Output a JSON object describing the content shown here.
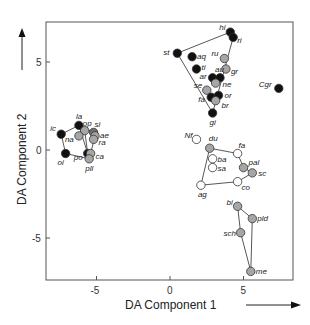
{
  "chart_data": {
    "type": "scatter",
    "title": "",
    "xlabel": "DA Component 1",
    "ylabel": "DA Component 2",
    "xlim": [
      -8.5,
      8.3
    ],
    "ylim": [
      -7.4,
      7.2
    ],
    "xticks": [
      -5,
      0,
      5
    ],
    "yticks": [
      -5,
      0,
      5
    ],
    "grid": false,
    "legend": null,
    "colors": {
      "black": "#111111",
      "gray": "#a6a6a6",
      "darkgray": "#6e6e6e",
      "white": "#ffffff"
    },
    "points": [
      {
        "label": "hi",
        "x": 4.1,
        "y": 6.7,
        "fill": "black",
        "lx": -11,
        "ly": -2
      },
      {
        "label": "ri",
        "x": 4.3,
        "y": 6.4,
        "fill": "black",
        "lx": 4,
        "ly": 6
      },
      {
        "label": "st",
        "x": 0.5,
        "y": 5.5,
        "fill": "black",
        "lx": -14,
        "ly": 2
      },
      {
        "label": "aq",
        "x": 1.5,
        "y": 5.3,
        "fill": "black",
        "lx": 5,
        "ly": 2
      },
      {
        "label": "ti",
        "x": 1.8,
        "y": 4.6,
        "fill": "black",
        "lx": 5,
        "ly": 1
      },
      {
        "label": "ru",
        "x": 3.7,
        "y": 5.2,
        "fill": "gray",
        "lx": -13,
        "ly": -3
      },
      {
        "label": "gr",
        "x": 3.8,
        "y": 4.6,
        "fill": "gray",
        "lx": 5,
        "ly": 5
      },
      {
        "label": "ar",
        "x": 2.9,
        "y": 4.1,
        "fill": "black",
        "lx": -13,
        "ly": 1
      },
      {
        "label": "au",
        "x": 3.4,
        "y": 4.1,
        "fill": "black",
        "lx": -5,
        "ly": -6
      },
      {
        "label": "ne",
        "x": 3.1,
        "y": 3.8,
        "fill": "gray",
        "lx": 7,
        "ly": 4
      },
      {
        "label": "se",
        "x": 2.5,
        "y": 3.4,
        "fill": "gray",
        "lx": -13,
        "ly": -2
      },
      {
        "label": "or",
        "x": 3.3,
        "y": 3.1,
        "fill": "black",
        "lx": 6,
        "ly": 3
      },
      {
        "label": "fa",
        "x": 2.8,
        "y": 3.0,
        "fill": "black",
        "lx": -13,
        "ly": 5
      },
      {
        "label": "br",
        "x": 3.1,
        "y": 2.8,
        "fill": "gray",
        "lx": 6,
        "ly": 7
      },
      {
        "label": "gi",
        "x": 2.9,
        "y": 2.1,
        "fill": "black",
        "lx": -3,
        "ly": 12
      },
      {
        "label": "Cgr",
        "x": 7.4,
        "y": 3.5,
        "fill": "black",
        "lx": -20,
        "ly": -1
      },
      {
        "label": "la",
        "x": -6.2,
        "y": 1.4,
        "fill": "black",
        "lx": -3,
        "ly": -6
      },
      {
        "label": "ic",
        "x": -7.4,
        "y": 0.9,
        "fill": "black",
        "lx": -11,
        "ly": -3
      },
      {
        "label": "op",
        "x": -5.8,
        "y": 1.1,
        "fill": "gray",
        "lx": -2,
        "ly": -5
      },
      {
        "label": "si",
        "x": -5.2,
        "y": 1.0,
        "fill": "darkgray",
        "lx": 1,
        "ly": -5
      },
      {
        "label": "ae",
        "x": -5.1,
        "y": 0.8,
        "fill": "gray",
        "lx": 5,
        "ly": 2
      },
      {
        "label": "na",
        "x": -6.2,
        "y": 0.8,
        "fill": "gray",
        "lx": -14,
        "ly": 6
      },
      {
        "label": "ra",
        "x": -5.2,
        "y": 0.6,
        "fill": "gray",
        "lx": 5,
        "ly": 6
      },
      {
        "label": "oi",
        "x": -7.1,
        "y": -0.2,
        "fill": "black",
        "lx": -8,
        "ly": 11
      },
      {
        "label": "po",
        "x": -5.6,
        "y": -0.2,
        "fill": "black",
        "lx": -14,
        "ly": 6
      },
      {
        "label": "ca",
        "x": -5.4,
        "y": -0.2,
        "fill": "gray",
        "lx": 5,
        "ly": 5
      },
      {
        "label": "pll",
        "x": -5.5,
        "y": -0.5,
        "fill": "gray",
        "lx": -4,
        "ly": 12
      },
      {
        "label": "Nf",
        "x": 1.8,
        "y": 0.6,
        "fill": "white",
        "lx": -12,
        "ly": -1
      },
      {
        "label": "du",
        "x": 2.7,
        "y": 0.1,
        "fill": "gray",
        "lx": -1,
        "ly": -7
      },
      {
        "label": "fa",
        "x": 4.6,
        "y": -0.2,
        "fill": "white",
        "lx": 1,
        "ly": -6
      },
      {
        "label": "ba",
        "x": 2.9,
        "y": -0.5,
        "fill": "white",
        "lx": 5,
        "ly": 3
      },
      {
        "label": "sa",
        "x": 2.9,
        "y": -1.0,
        "fill": "white",
        "lx": 5,
        "ly": 3
      },
      {
        "label": "pal",
        "x": 5.0,
        "y": -1.0,
        "fill": "gray",
        "lx": 5,
        "ly": -3
      },
      {
        "label": "sc",
        "x": 5.6,
        "y": -1.3,
        "fill": "gray",
        "lx": 6,
        "ly": 3
      },
      {
        "label": "co",
        "x": 4.6,
        "y": -1.8,
        "fill": "white",
        "lx": 4,
        "ly": 8
      },
      {
        "label": "ag",
        "x": 2.1,
        "y": -2.0,
        "fill": "white",
        "lx": -3,
        "ly": 12
      },
      {
        "label": "bi",
        "x": 4.6,
        "y": -3.2,
        "fill": "gray",
        "lx": -11,
        "ly": -1
      },
      {
        "label": "pld",
        "x": 5.6,
        "y": -3.9,
        "fill": "gray",
        "lx": 5,
        "ly": 2
      },
      {
        "label": "sch",
        "x": 4.8,
        "y": -4.7,
        "fill": "gray",
        "lx": -17,
        "ly": 3
      },
      {
        "label": "me",
        "x": 5.5,
        "y": -6.9,
        "fill": "gray",
        "lx": 5,
        "ly": 3
      }
    ],
    "hulls": [
      {
        "name": "upper-group",
        "points": [
          [
            0.5,
            5.5
          ],
          [
            4.1,
            6.7
          ],
          [
            4.3,
            6.4
          ],
          [
            2.9,
            2.1
          ]
        ]
      },
      {
        "name": "left-group",
        "points": [
          [
            -7.4,
            0.9
          ],
          [
            -6.2,
            1.4
          ],
          [
            -5.2,
            1.0
          ],
          [
            -5.1,
            0.8
          ],
          [
            -5.4,
            -0.2
          ],
          [
            -5.5,
            -0.5
          ],
          [
            -7.1,
            -0.2
          ]
        ]
      },
      {
        "name": "left-group-inner",
        "points": [
          [
            -6.2,
            1.4
          ],
          [
            -5.8,
            1.1
          ],
          [
            -5.6,
            -0.2
          ]
        ]
      },
      {
        "name": "middle-group",
        "points": [
          [
            2.7,
            0.1
          ],
          [
            4.6,
            -0.2
          ],
          [
            5.0,
            -1.0
          ],
          [
            5.6,
            -1.3
          ],
          [
            4.6,
            -1.8
          ],
          [
            2.1,
            -2.0
          ]
        ]
      },
      {
        "name": "lower-group",
        "points": [
          [
            4.6,
            -3.2
          ],
          [
            5.6,
            -3.9
          ],
          [
            5.5,
            -6.9
          ],
          [
            4.8,
            -4.7
          ]
        ]
      }
    ]
  }
}
